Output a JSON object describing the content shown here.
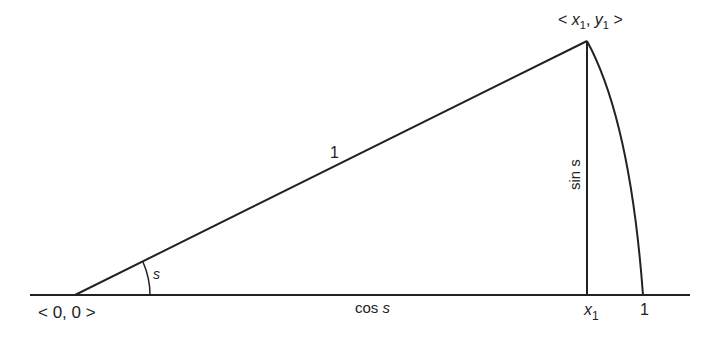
{
  "diagram": {
    "type": "unit-circle-triangle",
    "colors": {
      "stroke": "#222222",
      "background": "#ffffff"
    },
    "labels": {
      "origin": "< 0, 0 >",
      "point_open": "< ",
      "point_x": "x",
      "point_x_sub": "1",
      "point_sep": ", ",
      "point_y": "y",
      "point_y_sub": "1",
      "point_close": " >",
      "hypotenuse": "1",
      "angle": "s",
      "opposite": "sin s",
      "adjacent_fn": "cos ",
      "adjacent_var": "s",
      "foot_x": "x",
      "foot_x_sub": "1",
      "arc_end": "1"
    }
  }
}
